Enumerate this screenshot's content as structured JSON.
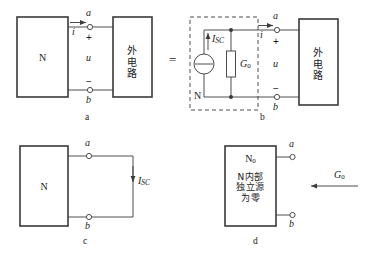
{
  "figure": {
    "background_color": "#ffffff",
    "line_color": "#3a3a3a",
    "text_color": "#1a1a1a"
  },
  "panels": [
    {
      "id": "a",
      "caption": "a",
      "network_box_label": "N",
      "external_box_label": "外电路",
      "terminal_top": "a",
      "terminal_bottom": "b",
      "current_label": "i",
      "voltage_label": "u",
      "polarity_plus": "+",
      "polarity_minus": "−"
    },
    {
      "id": "b",
      "caption": "b",
      "dashed_box_label": "N",
      "source_label": "I_SC",
      "source_label_main": "I",
      "source_label_sub": "SC",
      "conductance_label_main": "G",
      "conductance_label_sub": "0",
      "external_box_label": "外电路",
      "terminal_top": "a",
      "terminal_bottom": "b",
      "current_label": "i",
      "voltage_label": "u",
      "polarity_plus": "+",
      "polarity_minus": "−",
      "equals_sign": "="
    },
    {
      "id": "c",
      "caption": "c",
      "network_box_label": "N",
      "terminal_top": "a",
      "terminal_bottom": "b",
      "short_circuit_current_main": "I",
      "short_circuit_current_sub": "SC"
    },
    {
      "id": "d",
      "caption": "d",
      "network_box_label_main": "N",
      "network_box_label_sub": "0",
      "network_box_text_lines": [
        "N内部",
        "独立源",
        "为零"
      ],
      "terminal_top": "a",
      "terminal_bottom": "b",
      "conductance_label_main": "G",
      "conductance_label_sub": "0"
    }
  ],
  "icons": {
    "current_source": "current-source-icon",
    "resistor": "resistor-icon",
    "arrow_right": "arrow-right-icon",
    "arrow_down": "arrow-down-icon",
    "arrow_left": "arrow-left-icon",
    "terminal": "terminal-circle-icon"
  }
}
